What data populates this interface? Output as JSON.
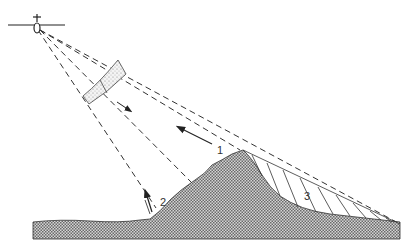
{
  "diagram": {
    "labels": {
      "one": "1",
      "two": "2",
      "three": "3"
    },
    "elements": {
      "aircraft": "aircraft-icon",
      "pulse": "radar-pulse-band",
      "foreshortening_arrow": "arrow-1",
      "layover_arrow": "arrow-2",
      "shadow_region": "radar-shadow-3",
      "terrain": "mountain-terrain"
    },
    "colors": {
      "line": "#222222",
      "terrain_fill": "#9a9a9a",
      "background": "#ffffff"
    }
  }
}
